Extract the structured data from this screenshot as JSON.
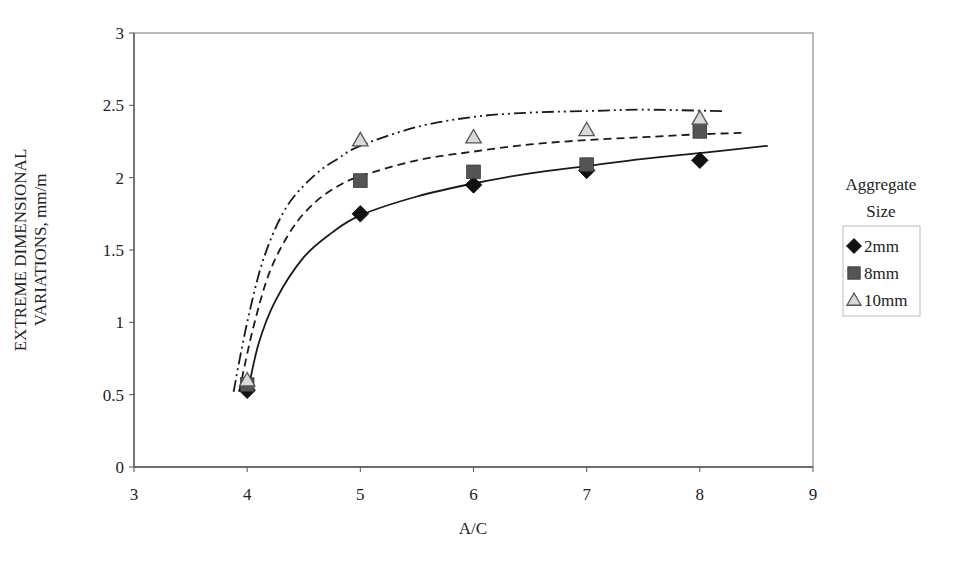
{
  "chart_data": {
    "type": "scatter",
    "title": "",
    "xlabel": "A/C",
    "ylabel_lines": [
      "EXTREME DIMENSIONAL",
      "VARIATIONS, mm/m"
    ],
    "xlim": [
      3,
      9
    ],
    "ylim": [
      0,
      3
    ],
    "xticks": [
      3,
      4,
      5,
      6,
      7,
      8,
      9
    ],
    "yticks": [
      0,
      0.5,
      1,
      1.5,
      2,
      2.5,
      3
    ],
    "grid": false,
    "legend_title_lines": [
      "Aggregate",
      "Size"
    ],
    "legend_position": "right",
    "series": [
      {
        "name": "2mm",
        "marker": "diamond",
        "color": "#111111",
        "x": [
          4,
          5,
          6,
          7,
          8
        ],
        "values": [
          0.53,
          1.75,
          1.95,
          2.05,
          2.12
        ],
        "trendline": {
          "style": "solid",
          "points": [
            [
              4.0,
              0.5
            ],
            [
              4.1,
              0.85
            ],
            [
              4.25,
              1.15
            ],
            [
              4.5,
              1.45
            ],
            [
              4.75,
              1.62
            ],
            [
              5.0,
              1.74
            ],
            [
              5.5,
              1.87
            ],
            [
              6.0,
              1.96
            ],
            [
              6.5,
              2.03
            ],
            [
              7.0,
              2.08
            ],
            [
              7.5,
              2.13
            ],
            [
              8.0,
              2.17
            ],
            [
              8.6,
              2.22
            ]
          ]
        }
      },
      {
        "name": "8mm",
        "marker": "square",
        "color": "#555555",
        "x": [
          4,
          5,
          6,
          7,
          8
        ],
        "values": [
          0.57,
          1.98,
          2.04,
          2.09,
          2.32
        ],
        "trendline": {
          "style": "dashed",
          "points": [
            [
              3.93,
              0.52
            ],
            [
              4.05,
              0.95
            ],
            [
              4.2,
              1.35
            ],
            [
              4.4,
              1.65
            ],
            [
              4.6,
              1.83
            ],
            [
              4.8,
              1.94
            ],
            [
              5.0,
              2.01
            ],
            [
              5.5,
              2.12
            ],
            [
              6.0,
              2.18
            ],
            [
              6.5,
              2.23
            ],
            [
              7.0,
              2.26
            ],
            [
              7.5,
              2.28
            ],
            [
              8.0,
              2.3
            ],
            [
              8.4,
              2.31
            ]
          ]
        }
      },
      {
        "name": "10mm",
        "marker": "triangle",
        "color": "#d9d9d9",
        "x": [
          4,
          5,
          6,
          7,
          8
        ],
        "values": [
          0.6,
          2.26,
          2.28,
          2.33,
          2.41
        ],
        "trendline": {
          "style": "dash-dot-dot",
          "points": [
            [
              3.88,
              0.52
            ],
            [
              4.0,
              1.0
            ],
            [
              4.15,
              1.45
            ],
            [
              4.35,
              1.8
            ],
            [
              4.6,
              2.02
            ],
            [
              4.8,
              2.13
            ],
            [
              5.0,
              2.22
            ],
            [
              5.5,
              2.35
            ],
            [
              6.0,
              2.42
            ],
            [
              6.5,
              2.45
            ],
            [
              7.0,
              2.46
            ],
            [
              7.5,
              2.47
            ],
            [
              8.2,
              2.46
            ]
          ]
        }
      }
    ]
  }
}
